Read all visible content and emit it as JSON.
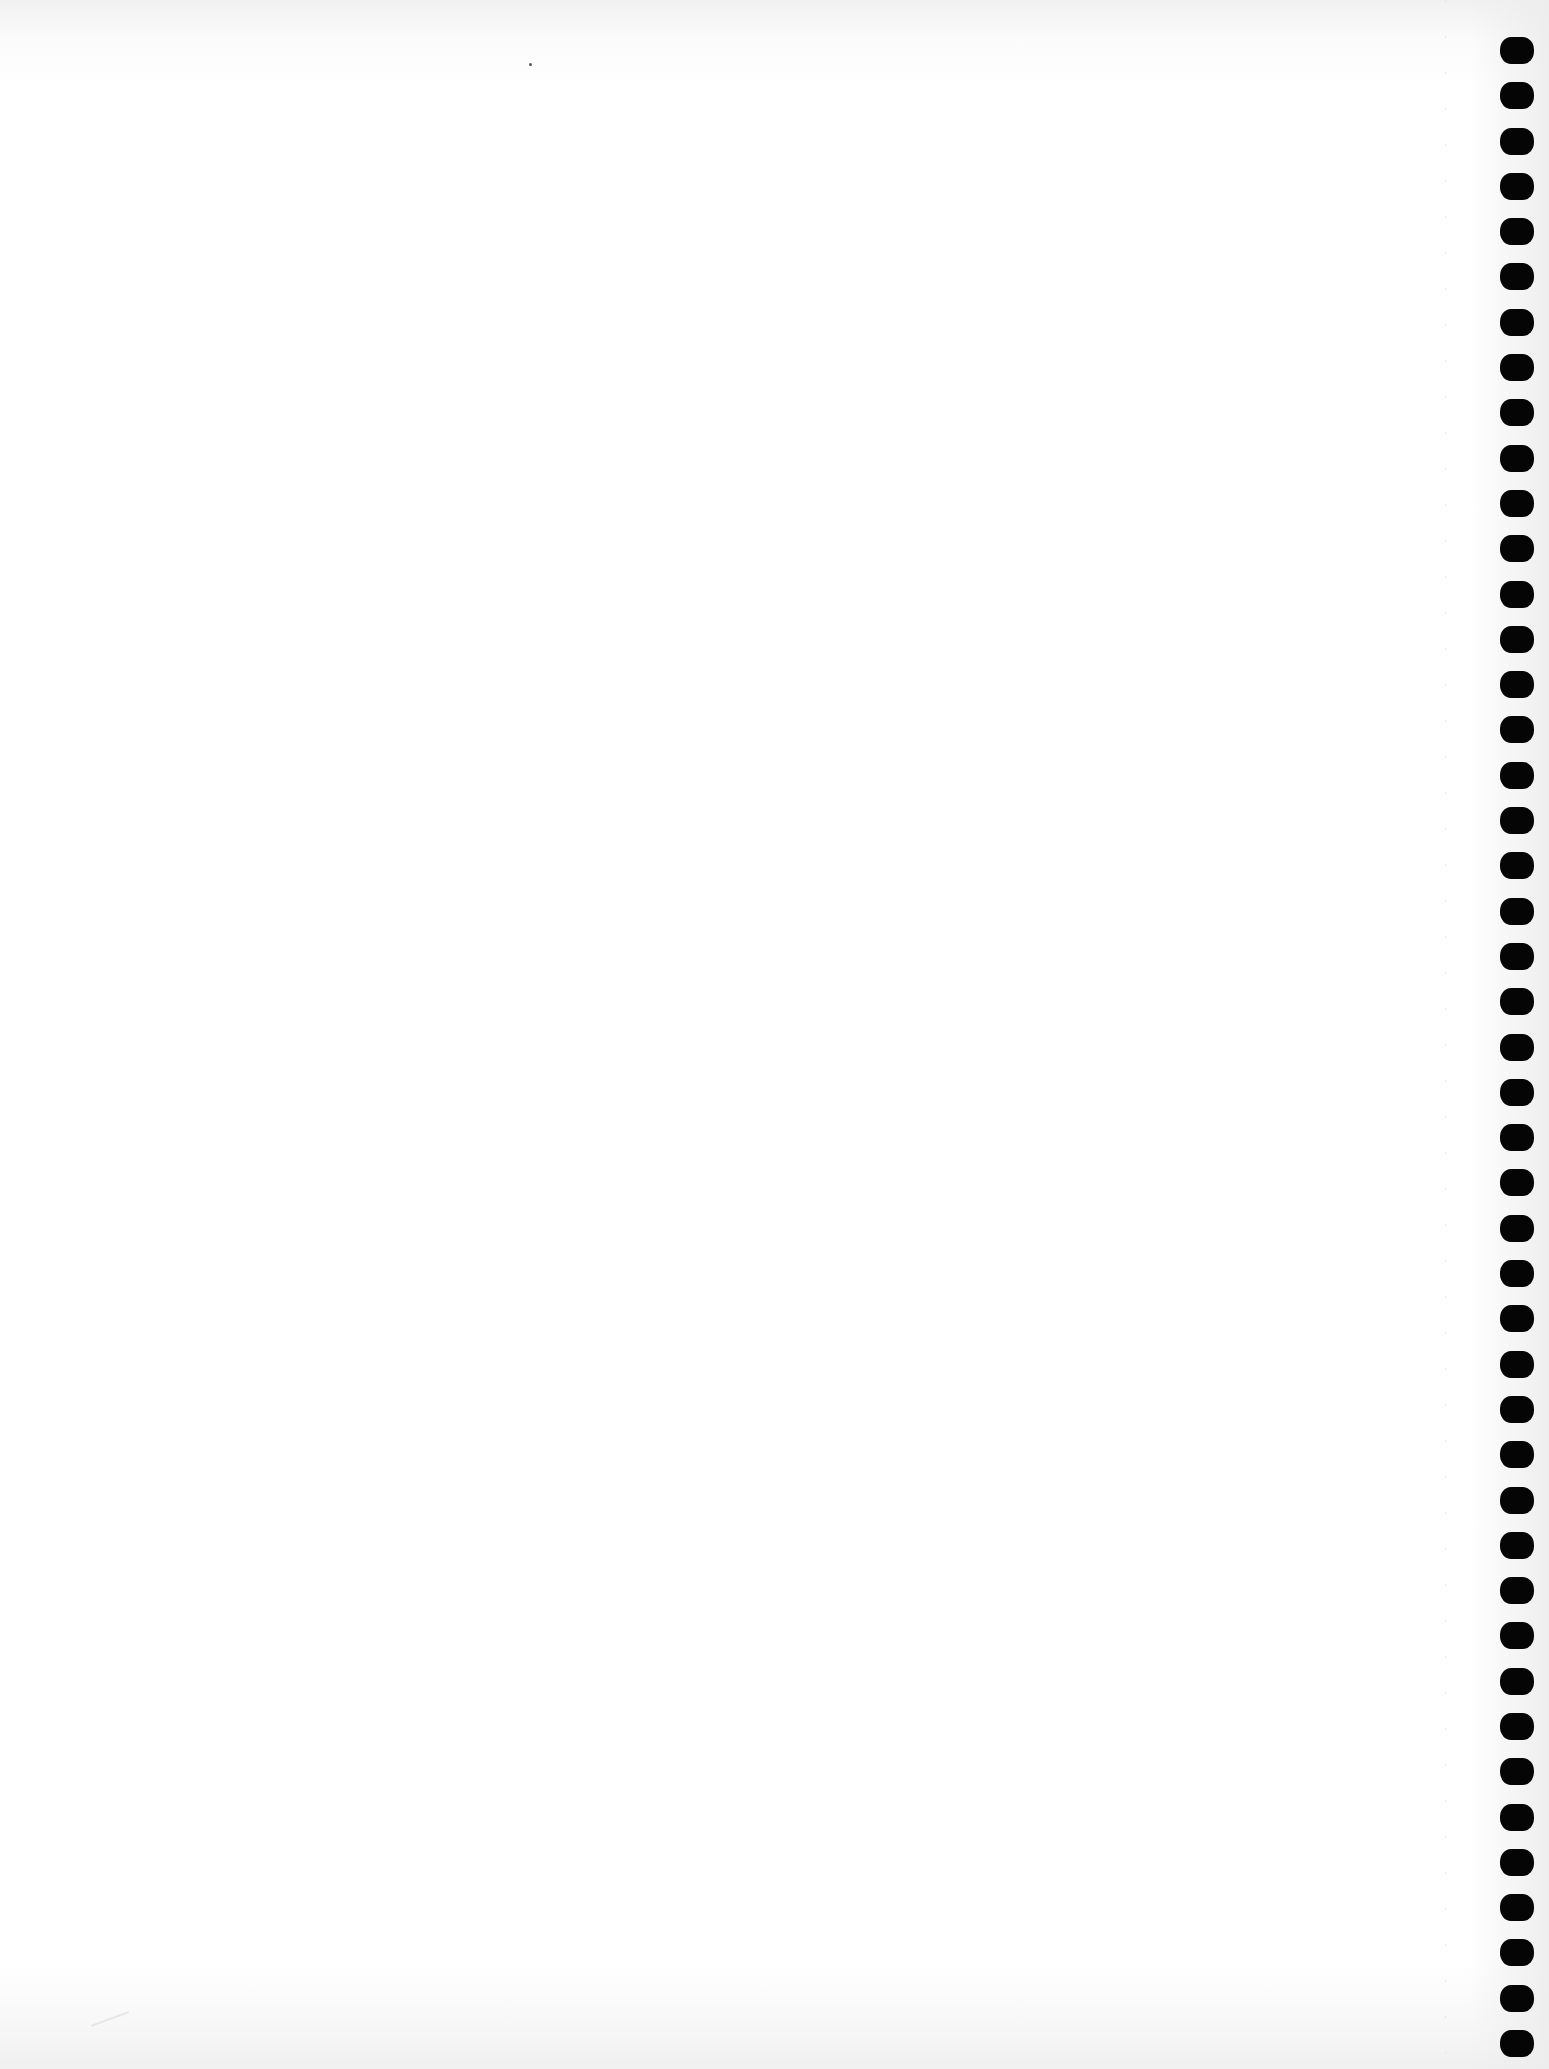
{
  "page": {
    "type": "blank notebook sheet scan",
    "background_color": "#ffffff",
    "binding_side": "right"
  },
  "binding": {
    "hole_count": 45,
    "hole_color": "#050505",
    "hole_shape": "rounded-rectangle"
  },
  "content": {
    "text": ""
  }
}
